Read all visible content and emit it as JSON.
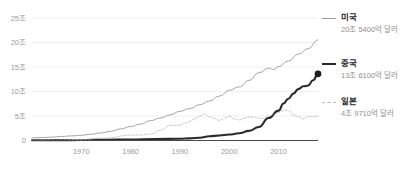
{
  "chart_data": {
    "type": "line",
    "title": "",
    "subtitle": "",
    "xlabel": "",
    "ylabel": "",
    "xlim": [
      1960,
      2018
    ],
    "ylim": [
      0,
      25
    ],
    "grid": true,
    "grid_axis": "y",
    "legend_position": "right",
    "y_unit": "조",
    "y_ticks": [
      0,
      5,
      10,
      15,
      20,
      25
    ],
    "y_tick_labels": [
      "0",
      "5조",
      "10조",
      "15조",
      "20조",
      "25조"
    ],
    "x_ticks": [
      1970,
      1980,
      1990,
      2000,
      2010
    ],
    "x_tick_labels": [
      "1970",
      "1980",
      "1990",
      "2000",
      "2010"
    ],
    "series": [
      {
        "name": "미국",
        "value_label": "20조 5400억 달러",
        "style": "thin-solid",
        "color": "#9a9a9a",
        "endpoint_marker": false,
        "x": [
          1960,
          1962,
          1964,
          1966,
          1968,
          1970,
          1972,
          1974,
          1976,
          1978,
          1980,
          1982,
          1984,
          1986,
          1988,
          1990,
          1992,
          1994,
          1996,
          1998,
          2000,
          2002,
          2004,
          2006,
          2008,
          2009,
          2010,
          2012,
          2014,
          2016,
          2018
        ],
        "values": [
          0.54,
          0.6,
          0.69,
          0.82,
          0.94,
          1.07,
          1.28,
          1.55,
          1.88,
          2.36,
          2.86,
          3.34,
          4.04,
          4.58,
          5.24,
          5.96,
          6.52,
          7.31,
          8.07,
          9.06,
          10.25,
          10.94,
          12.27,
          13.81,
          14.77,
          14.48,
          15.05,
          16.25,
          17.61,
          18.74,
          20.54
        ]
      },
      {
        "name": "중국",
        "value_label": "13조 6100억 달러",
        "style": "thick-solid",
        "color": "#2b2b2b",
        "endpoint_marker": true,
        "x": [
          1960,
          1965,
          1970,
          1975,
          1980,
          1985,
          1990,
          1992,
          1994,
          1996,
          1998,
          2000,
          2002,
          2004,
          2006,
          2008,
          2010,
          2011,
          2012,
          2013,
          2014,
          2015,
          2016,
          2017,
          2018
        ],
        "values": [
          0.06,
          0.07,
          0.09,
          0.16,
          0.19,
          0.31,
          0.36,
          0.43,
          0.56,
          0.86,
          1.03,
          1.21,
          1.47,
          1.96,
          2.75,
          4.59,
          6.09,
          7.55,
          8.53,
          9.57,
          10.48,
          11.06,
          11.23,
          12.31,
          13.61
        ]
      },
      {
        "name": "일본",
        "value_label": "4조 9710억 달러",
        "style": "dashed",
        "color": "#b9b9b9",
        "endpoint_marker": false,
        "x": [
          1960,
          1965,
          1970,
          1975,
          1980,
          1982,
          1984,
          1986,
          1988,
          1990,
          1991,
          1992,
          1993,
          1994,
          1995,
          1996,
          1997,
          1998,
          1999,
          2000,
          2001,
          2002,
          2003,
          2004,
          2005,
          2006,
          2007,
          2008,
          2009,
          2010,
          2011,
          2012,
          2013,
          2014,
          2015,
          2016,
          2017,
          2018
        ],
        "values": [
          0.04,
          0.09,
          0.21,
          0.52,
          1.1,
          1.13,
          1.31,
          2.08,
          3.07,
          3.13,
          3.58,
          3.91,
          4.45,
          4.91,
          5.45,
          4.83,
          4.49,
          4.1,
          4.56,
          4.97,
          4.37,
          4.18,
          4.52,
          4.82,
          4.76,
          4.53,
          4.52,
          5.04,
          5.23,
          5.7,
          6.16,
          6.2,
          5.16,
          4.85,
          4.39,
          4.93,
          4.87,
          4.97
        ]
      }
    ]
  },
  "legend": {
    "entries": [
      {
        "name": "미국",
        "value_label": "20조 5400억 달러"
      },
      {
        "name": "중국",
        "value_label": "13조 6100억 달러"
      },
      {
        "name": "일본",
        "value_label": "4조 9710억 달러"
      }
    ]
  }
}
